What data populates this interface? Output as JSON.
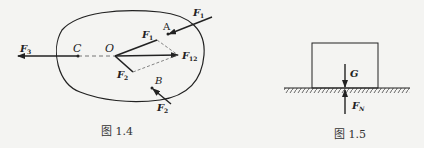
{
  "figure_1_4": {
    "caption": "图 1.4",
    "points": {
      "O": "O",
      "A": "A",
      "B": "B",
      "C": "C"
    },
    "forces": {
      "F1_label": "F",
      "F1_sub": "1",
      "F2_label": "F",
      "F2_sub": "2",
      "F3_label": "F",
      "F3_sub": "3",
      "F12_label": "F",
      "F12_sub": "12",
      "F1_inner_label": "F",
      "F1_inner_sub": "1",
      "F2_inner_label": "F",
      "F2_inner_sub": "2"
    }
  },
  "figure_1_5": {
    "caption": "图 1.5",
    "forces": {
      "G_label": "G",
      "FN_label": "F",
      "FN_sub": "N"
    }
  },
  "colors": {
    "background": "#f4f4f2",
    "ink": "#222222"
  }
}
